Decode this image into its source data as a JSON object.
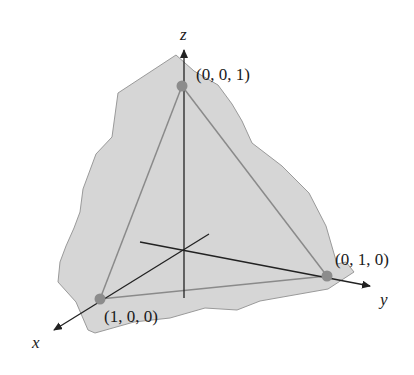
{
  "diagram": {
    "type": "3d-coordinate-plane-triangle",
    "colors": {
      "region_fill": "#d6d6d6",
      "region_stroke": "#9a9a9a",
      "triangle_stroke": "#8a8a8a",
      "axis_stroke": "#222222",
      "point_fill": "#8c8c8c"
    },
    "axes": {
      "x": {
        "label": "x"
      },
      "y": {
        "label": "y"
      },
      "z": {
        "label": "z"
      }
    },
    "points": [
      {
        "id": "p_z",
        "label": "(0, 0, 1)"
      },
      {
        "id": "p_y",
        "label": "(0, 1, 0)"
      },
      {
        "id": "p_x",
        "label": "(1, 0, 0)"
      }
    ]
  }
}
